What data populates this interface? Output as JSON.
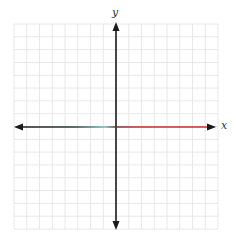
{
  "diagram": {
    "type": "coordinate-plane",
    "x_axis_label": "x",
    "y_axis_label": "y",
    "grid": {
      "columns": 16,
      "rows": 16,
      "left": 14,
      "top": 24,
      "right": 218,
      "bottom": 229,
      "line_color": "#e2e2e2"
    },
    "origin": {
      "x": 116,
      "y": 127
    },
    "colors": {
      "axis": "#1a1a1a",
      "x_axis_left": "#1a1a1a",
      "x_axis_mid": "#8fd3d8",
      "x_axis_right": "#d42a2a"
    }
  }
}
